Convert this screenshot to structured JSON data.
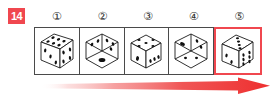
{
  "question": {
    "number": "14",
    "badge_color": "#f0474f"
  },
  "options": {
    "labels": [
      "①",
      "②",
      "③",
      "④",
      "⑤"
    ],
    "selected_index": 4,
    "selection_color": "#f0474f"
  },
  "dice": [
    {
      "label": "die-1",
      "orientation": "cube-three-quarter",
      "faces": {
        "top": 6,
        "left": 3,
        "right": 4
      }
    },
    {
      "label": "die-2",
      "orientation": "cube-vertex-on",
      "faces": {
        "top_left": 2,
        "top_right": 3,
        "front": 1
      }
    },
    {
      "label": "die-3",
      "orientation": "cube-three-quarter",
      "faces": {
        "top": 5,
        "left": 1,
        "right": 3
      }
    },
    {
      "label": "die-4",
      "orientation": "cube-vertex-on",
      "faces": {
        "top_left": 1,
        "top_right": 2,
        "front": 2
      }
    },
    {
      "label": "die-5",
      "orientation": "cube-three-quarter",
      "faces": {
        "top": 4,
        "left": 2,
        "right": 6
      }
    }
  ],
  "arrow": {
    "name": "progress-arrow",
    "direction": "right",
    "color_start": "#ffffff",
    "color_end": "#ef3b3b"
  },
  "colors": {
    "background": "#ffffff",
    "grid_line": "#4a4a4a",
    "pip": "#111111",
    "accent_red": "#f0474f"
  }
}
